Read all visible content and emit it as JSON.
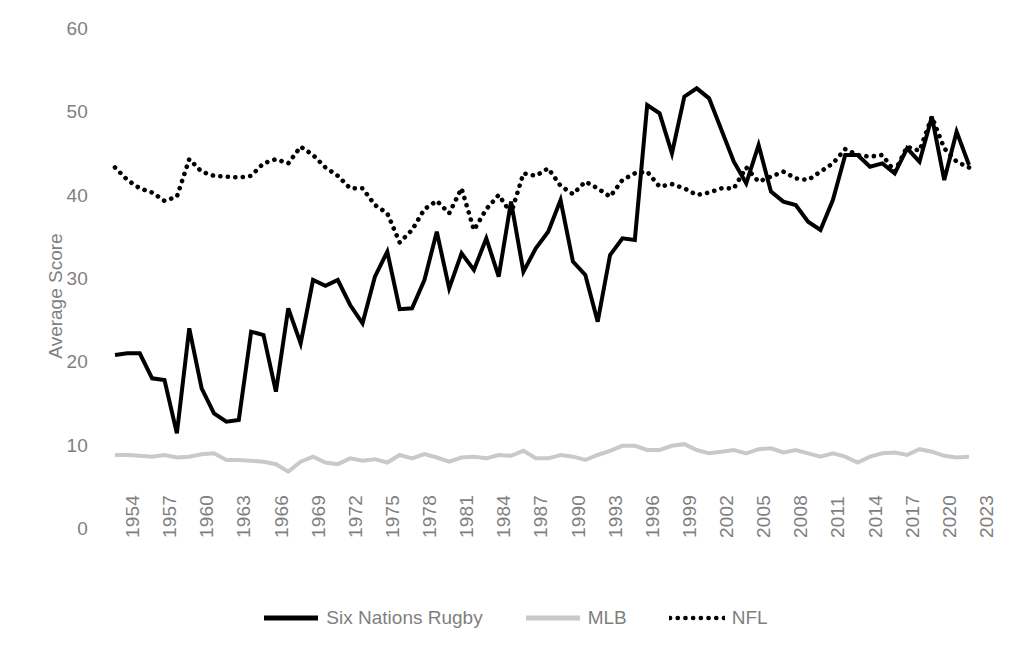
{
  "chart_data": {
    "type": "line",
    "title": "",
    "xlabel": "",
    "ylabel": "Average Score",
    "ylim": [
      0,
      60
    ],
    "ytick_labels": [
      "0",
      "10",
      "20",
      "30",
      "40",
      "50",
      "60"
    ],
    "yticks": [
      0,
      10,
      20,
      30,
      40,
      50,
      60
    ],
    "grid": false,
    "legend_position": "bottom",
    "x": [
      1954,
      1955,
      1956,
      1957,
      1958,
      1959,
      1960,
      1961,
      1962,
      1963,
      1964,
      1965,
      1966,
      1967,
      1968,
      1969,
      1970,
      1971,
      1972,
      1973,
      1974,
      1975,
      1976,
      1977,
      1978,
      1979,
      1980,
      1981,
      1982,
      1983,
      1984,
      1985,
      1986,
      1987,
      1988,
      1989,
      1990,
      1991,
      1992,
      1993,
      1994,
      1995,
      1996,
      1997,
      1998,
      1999,
      2000,
      2001,
      2002,
      2003,
      2004,
      2005,
      2006,
      2007,
      2008,
      2009,
      2010,
      2011,
      2012,
      2013,
      2014,
      2015,
      2016,
      2017,
      2018,
      2019,
      2020,
      2021,
      2022,
      2023
    ],
    "xtick_labels": [
      "1954",
      "1957",
      "1960",
      "1963",
      "1966",
      "1969",
      "1972",
      "1975",
      "1978",
      "1981",
      "1984",
      "1987",
      "1990",
      "1993",
      "1996",
      "1999",
      "2002",
      "2005",
      "2008",
      "2011",
      "2014",
      "2017",
      "2020",
      "2023"
    ],
    "xtick_values": [
      1954,
      1957,
      1960,
      1963,
      1966,
      1969,
      1972,
      1975,
      1978,
      1981,
      1984,
      1987,
      1990,
      1993,
      1996,
      1999,
      2002,
      2005,
      2008,
      2011,
      2014,
      2017,
      2020,
      2023
    ],
    "series": [
      {
        "name": "Six Nations Rugby",
        "style": "solid",
        "color": "#000000",
        "width": 4,
        "values": [
          21.0,
          21.2,
          21.2,
          18.2,
          18.0,
          11.6,
          24.2,
          17.0,
          14.0,
          13.0,
          13.2,
          23.8,
          23.4,
          16.6,
          26.6,
          22.4,
          30.0,
          29.3,
          30.0,
          27.0,
          24.8,
          30.4,
          33.4,
          26.5,
          26.6,
          30.0,
          35.8,
          29.0,
          33.2,
          31.2,
          35.0,
          30.4,
          39.4,
          31.0,
          33.8,
          35.8,
          39.6,
          32.2,
          30.6,
          25.0,
          33.0,
          35.0,
          34.8,
          51.0,
          50.0,
          45.2,
          52.0,
          53.0,
          51.8,
          48.0,
          44.2,
          41.6,
          46.2,
          40.6,
          39.4,
          39.0,
          37.0,
          36.0,
          39.6,
          45.0,
          45.0,
          43.6,
          44.0,
          42.8,
          45.8,
          44.2,
          49.6,
          42.0,
          47.8,
          43.8
        ]
      },
      {
        "name": "MLB",
        "style": "solid",
        "color": "#c9c9c9",
        "width": 4,
        "values": [
          9.0,
          9.0,
          8.9,
          8.8,
          9.0,
          8.7,
          8.8,
          9.1,
          9.2,
          8.4,
          8.4,
          8.3,
          8.2,
          7.9,
          7.0,
          8.2,
          8.8,
          8.1,
          7.9,
          8.6,
          8.3,
          8.5,
          8.1,
          9.0,
          8.6,
          9.1,
          8.7,
          8.2,
          8.7,
          8.8,
          8.6,
          9.0,
          8.9,
          9.5,
          8.6,
          8.6,
          9.0,
          8.8,
          8.4,
          9.0,
          9.5,
          10.1,
          10.1,
          9.6,
          9.6,
          10.1,
          10.3,
          9.6,
          9.2,
          9.4,
          9.6,
          9.2,
          9.7,
          9.8,
          9.3,
          9.6,
          9.2,
          8.8,
          9.2,
          8.8,
          8.1,
          8.8,
          9.2,
          9.3,
          9.0,
          9.7,
          9.4,
          8.9,
          8.7,
          8.8
        ]
      },
      {
        "name": "NFL",
        "style": "dotted",
        "color": "#000000",
        "width": 4,
        "values": [
          43.5,
          42.0,
          41.0,
          40.5,
          39.5,
          40.0,
          44.5,
          43.0,
          42.5,
          42.4,
          42.3,
          42.5,
          44.0,
          44.5,
          44.0,
          46.0,
          45.0,
          43.5,
          42.5,
          41.0,
          41.0,
          39.0,
          38.0,
          34.5,
          36.0,
          38.5,
          39.5,
          38.0,
          41.0,
          36.0,
          38.5,
          40.2,
          38.0,
          42.8,
          42.5,
          43.4,
          41.3,
          40.3,
          41.8,
          41.0,
          40.0,
          42.0,
          42.8,
          43.0,
          41.2,
          41.5,
          41.0,
          40.2,
          40.5,
          41.0,
          41.0,
          43.5,
          41.8,
          42.4,
          43.0,
          42.2,
          42.0,
          43.0,
          44.0,
          45.7,
          45.0,
          44.8,
          45.0,
          43.0,
          46.0,
          45.5,
          49.6,
          45.8,
          44.2,
          43.5
        ]
      }
    ]
  },
  "legend": {
    "items": [
      {
        "label": "Six Nations Rugby",
        "swatch": "solid-line-black",
        "color": "#000000"
      },
      {
        "label": "MLB",
        "swatch": "solid-line-gray",
        "color": "#c9c9c9"
      },
      {
        "label": "NFL",
        "swatch": "dotted-line-black",
        "color": "#000000"
      }
    ]
  },
  "axes": {
    "y_title": "Average Score",
    "tick_color": "#7f7f7f"
  }
}
